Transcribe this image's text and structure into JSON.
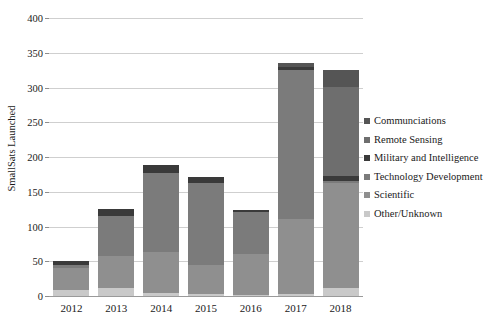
{
  "chart_data": {
    "type": "bar",
    "stacked": true,
    "title": "",
    "xlabel": "",
    "ylabel": "SmallSats Launched",
    "ylim": [
      0,
      400
    ],
    "ytick_step": 50,
    "ytick_labels": [
      "0",
      "50",
      "100",
      "150",
      "200",
      "250",
      "300",
      "350",
      "400"
    ],
    "grid": true,
    "legend_position": "right",
    "categories": [
      "2012",
      "2013",
      "2014",
      "2015",
      "2016",
      "2017",
      "2018"
    ],
    "series": [
      {
        "name": "Other/Unknown",
        "color": "#c9c9c9",
        "values": [
          8,
          12,
          4,
          3,
          2,
          3,
          12
        ]
      },
      {
        "name": "Scientific",
        "color": "#8f8f8f",
        "values": [
          32,
          45,
          59,
          41,
          58,
          108,
          150
        ]
      },
      {
        "name": "Technology Development",
        "color": "#7b7b7b",
        "values": [
          4,
          58,
          114,
          118,
          61,
          214,
          4
        ]
      },
      {
        "name": "Military and Intelligence",
        "color": "#3a3a3a",
        "values": [
          7,
          10,
          11,
          9,
          3,
          4,
          7
        ]
      },
      {
        "name": "Remote Sensing",
        "color": "#6e6e6e",
        "values": [
          0,
          0,
          0,
          0,
          0,
          0,
          128
        ]
      },
      {
        "name": "Communciations",
        "color": "#555555",
        "values": [
          0,
          0,
          0,
          0,
          0,
          6,
          24
        ]
      }
    ],
    "totals": [
      51,
      125,
      188,
      171,
      124,
      335,
      325
    ]
  },
  "legend": {
    "items": [
      {
        "label": "Communciations",
        "color": "#555555"
      },
      {
        "label": "Remote Sensing",
        "color": "#6e6e6e"
      },
      {
        "label": "Military and Intelligence",
        "color": "#3a3a3a"
      },
      {
        "label": "Technology Development",
        "color": "#7b7b7b"
      },
      {
        "label": "Scientific",
        "color": "#8f8f8f"
      },
      {
        "label": "Other/Unknown",
        "color": "#c9c9c9"
      }
    ]
  }
}
